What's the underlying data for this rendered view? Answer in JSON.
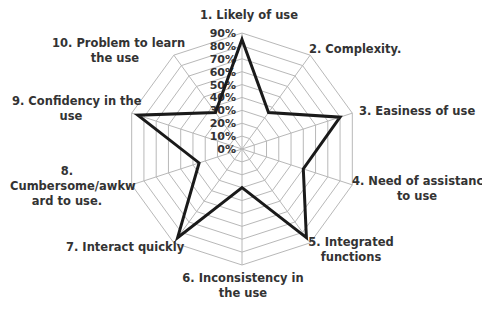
{
  "chart_data": {
    "type": "radar",
    "title": "",
    "axes": [
      "1. Likely of use",
      "2. Complexity.",
      "3. Easiness of use",
      "4. Need of assistance to use",
      "5. Integrated functions",
      "6. Inconsistency in the use",
      "7. Interact quickly",
      "8. Cumbersome/awkward to use.",
      "9. Confidency in the use",
      "10. Problem to learn the use"
    ],
    "series": [
      {
        "name": "",
        "values": [
          85,
          35,
          80,
          50,
          85,
          30,
          85,
          35,
          85,
          35
        ]
      }
    ],
    "ticks": [
      "0%",
      "10%",
      "20%",
      "30%",
      "40%",
      "50%",
      "60%",
      "70%",
      "80%",
      "90%"
    ],
    "rlim": [
      0,
      90
    ],
    "grid": true,
    "legend": "none"
  },
  "labels": {
    "a1": [
      "1. Likely of use"
    ],
    "a2": [
      "2. Complexity."
    ],
    "a3": [
      "3. Easiness of use"
    ],
    "a4": [
      "4. Need of assistance",
      "to use"
    ],
    "a5": [
      "5. Integrated",
      "functions"
    ],
    "a6": [
      "6. Inconsistency in",
      "the use"
    ],
    "a7": [
      "7. Interact quickly"
    ],
    "a8": [
      "8.",
      "Cumbersome/awkw",
      "ard to use."
    ],
    "a9": [
      "9. Confidency in the",
      "use"
    ],
    "a10": [
      "10. Problem to learn",
      "the use"
    ]
  },
  "colors": {
    "grid": "#b8b8b8",
    "series": "#1a1a1a",
    "text": "#333333"
  }
}
